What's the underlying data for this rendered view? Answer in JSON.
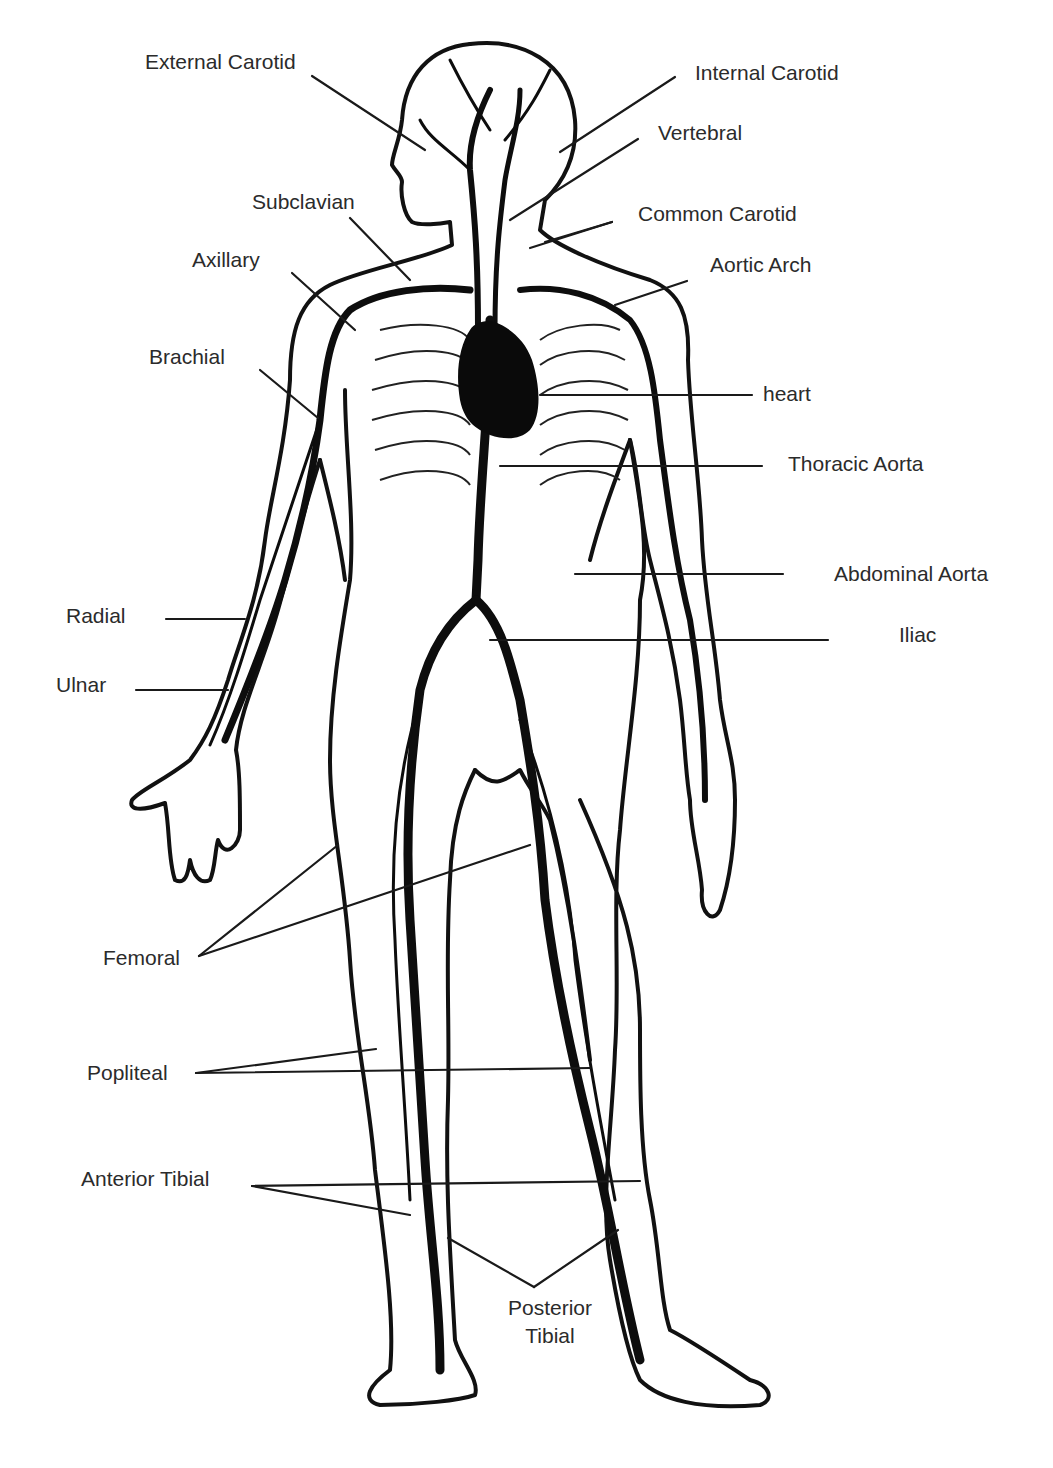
{
  "diagram": {
    "type": "anatomical-labeled-illustration",
    "colors": {
      "background": "#ffffff",
      "ink": "#111111",
      "label_text": "#2b2b2b",
      "leader_line": "#1a1a1a"
    },
    "labels": [
      {
        "id": "external-carotid",
        "text": "External Carotid",
        "x": 145,
        "y": 51,
        "leaders": [
          [
            312,
            76,
            425,
            150
          ]
        ]
      },
      {
        "id": "internal-carotid",
        "text": "Internal Carotid",
        "x": 695,
        "y": 62,
        "leaders": [
          [
            675,
            77,
            560,
            152
          ]
        ]
      },
      {
        "id": "vertebral",
        "text": "Vertebral",
        "x": 658,
        "y": 122,
        "leaders": [
          [
            638,
            139,
            510,
            220
          ]
        ]
      },
      {
        "id": "common-carotid",
        "text": "Common Carotid",
        "x": 638,
        "y": 203,
        "leaders": [
          [
            612,
            222,
            530,
            248
          ],
          [
            612,
            222,
            545,
            242
          ]
        ]
      },
      {
        "id": "aortic-arch",
        "text": "Aortic Arch",
        "x": 710,
        "y": 254,
        "leaders": [
          [
            687,
            281,
            615,
            305
          ]
        ]
      },
      {
        "id": "subclavian",
        "text": "Subclavian",
        "x": 252,
        "y": 191,
        "leaders": [
          [
            350,
            218,
            410,
            280
          ]
        ]
      },
      {
        "id": "axillary",
        "text": "Axillary",
        "x": 192,
        "y": 249,
        "leaders": [
          [
            292,
            273,
            355,
            330
          ]
        ]
      },
      {
        "id": "brachial",
        "text": "Brachial",
        "x": 149,
        "y": 346,
        "leaders": [
          [
            260,
            370,
            318,
            418
          ]
        ]
      },
      {
        "id": "heart",
        "text": "heart",
        "x": 763,
        "y": 383,
        "leaders": [
          [
            752,
            395,
            540,
            395
          ]
        ]
      },
      {
        "id": "thoracic-aorta",
        "text": "Thoracic Aorta",
        "x": 788,
        "y": 453,
        "leaders": [
          [
            762,
            466,
            500,
            466
          ]
        ]
      },
      {
        "id": "abdominal-aorta",
        "text": "Abdominal Aorta",
        "x": 834,
        "y": 563,
        "leaders": [
          [
            783,
            574,
            575,
            574
          ]
        ]
      },
      {
        "id": "iliac",
        "text": "Iliac",
        "x": 899,
        "y": 624,
        "leaders": [
          [
            828,
            640,
            490,
            640
          ]
        ]
      },
      {
        "id": "radial",
        "text": "Radial",
        "x": 66,
        "y": 605,
        "leaders": [
          [
            166,
            619,
            245,
            619
          ]
        ]
      },
      {
        "id": "ulnar",
        "text": "Ulnar",
        "x": 56,
        "y": 674,
        "leaders": [
          [
            136,
            690,
            228,
            690
          ]
        ]
      },
      {
        "id": "femoral",
        "text": "Femoral",
        "x": 103,
        "y": 947,
        "leaders": [
          [
            199,
            956,
            338,
            845
          ],
          [
            199,
            956,
            530,
            845
          ]
        ]
      },
      {
        "id": "popliteal",
        "text": "Popliteal",
        "x": 87,
        "y": 1062,
        "leaders": [
          [
            196,
            1073,
            376,
            1049
          ],
          [
            196,
            1073,
            590,
            1068
          ]
        ]
      },
      {
        "id": "anterior-tibial",
        "text": "Anterior Tibial",
        "x": 81,
        "y": 1168,
        "leaders": [
          [
            252,
            1186,
            640,
            1181
          ],
          [
            252,
            1186,
            410,
            1215
          ]
        ]
      },
      {
        "id": "posterior-tibial",
        "text": "Posterior\nTibial",
        "line1": "Posterior",
        "line2": "Tibial",
        "x": 550,
        "y": 1294,
        "leaders": [
          [
            534,
            1287,
            448,
            1238
          ],
          [
            534,
            1287,
            618,
            1230
          ]
        ]
      }
    ]
  }
}
